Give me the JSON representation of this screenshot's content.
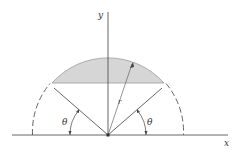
{
  "diagram": {
    "type": "geometry",
    "axes": {
      "x_label": "x",
      "y_label": "y"
    },
    "labels": {
      "radius": "r",
      "theta_left": "θ",
      "theta_right": "θ"
    },
    "colors": {
      "line": "#555555",
      "shade": "#d4d4d4",
      "shade_edge": "#9a9a9a",
      "background": "#ffffff"
    },
    "geometry": {
      "origin_px": [
        108,
        135
      ],
      "radius_px": 75,
      "theta_deg": 40,
      "chord_y_px": 83
    }
  }
}
